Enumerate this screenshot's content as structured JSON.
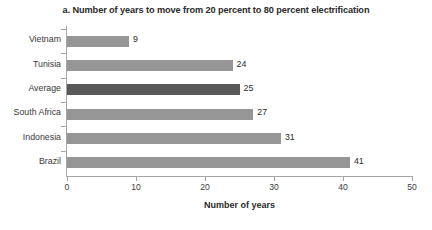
{
  "chart_data": {
    "type": "bar",
    "orientation": "horizontal",
    "title": "a. Number of years to move from 20 percent to 80 percent electrification",
    "xlabel": "Number of years",
    "ylabel": "",
    "xlim": [
      0,
      50
    ],
    "xticks": [
      0,
      10,
      20,
      30,
      40,
      50
    ],
    "xtick_labels": [
      "0",
      "10",
      "20",
      "30",
      "40",
      "50"
    ],
    "grid": false,
    "legend": false,
    "categories": [
      "Vietnam",
      "Tunisia",
      "Average",
      "South Africa",
      "Indonesia",
      "Brazil"
    ],
    "values": [
      9,
      24,
      25,
      27,
      31,
      41
    ],
    "data_labels": [
      "9",
      "24",
      "25",
      "27",
      "31",
      "41"
    ],
    "bar_colors": [
      "#969696",
      "#969696",
      "#595959",
      "#969696",
      "#969696",
      "#969696"
    ],
    "highlighted_category": "Average"
  },
  "colors": {
    "bar_default": "#969696",
    "bar_highlight": "#595959",
    "axis": "#a6a6a6",
    "text": "#3a3a3a",
    "title_text": "#2b2b2b",
    "background": "#ffffff"
  }
}
